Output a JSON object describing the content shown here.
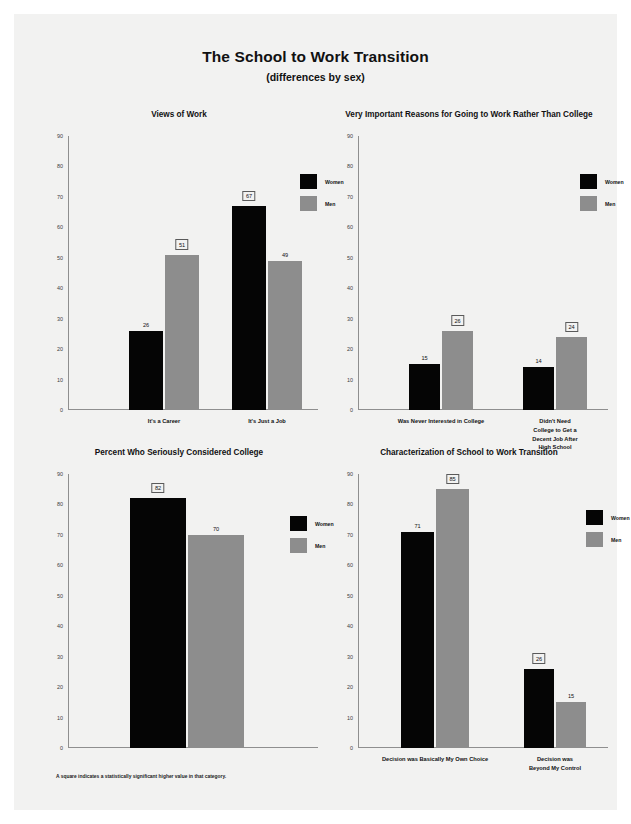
{
  "header": {
    "title": "The School to Work Transition",
    "subtitle": "(differences by sex)"
  },
  "legend": {
    "women_label": "Women",
    "men_label": "Men",
    "women_color": "#050505",
    "men_color": "#8d8d8d"
  },
  "footnote": "A square indicates a statistically significant higher value in that category.",
  "axis": {
    "ticks": [
      "0",
      "10",
      "20",
      "30",
      "40",
      "50",
      "60",
      "70",
      "80",
      "90"
    ],
    "min": 0,
    "max": 90
  },
  "chart_data": [
    {
      "type": "bar",
      "title": "Views of Work",
      "xlabel": "",
      "ylabel": "",
      "ylim": [
        0,
        90
      ],
      "grid": false,
      "legend_position": "top-right",
      "categories": [
        "It's a Career",
        "It's Just a Job"
      ],
      "series": [
        {
          "name": "Women",
          "values": [
            26,
            67
          ],
          "significant": [
            false,
            true
          ]
        },
        {
          "name": "Men",
          "values": [
            51,
            49
          ],
          "significant": [
            true,
            false
          ]
        }
      ]
    },
    {
      "type": "bar",
      "title": "Very Important Reasons for Going to Work Rather Than College",
      "xlabel": "",
      "ylabel": "",
      "ylim": [
        0,
        90
      ],
      "grid": false,
      "legend_position": "top-right",
      "categories": [
        "Was Never Interested in College",
        "Didn't Need College to Get a\nDecent Job After High School"
      ],
      "series": [
        {
          "name": "Women",
          "values": [
            15,
            14
          ],
          "significant": [
            false,
            false
          ]
        },
        {
          "name": "Men",
          "values": [
            26,
            24
          ],
          "significant": [
            true,
            true
          ]
        }
      ]
    },
    {
      "type": "bar",
      "title": "Percent Who Seriously Considered College",
      "xlabel": "",
      "ylabel": "",
      "ylim": [
        0,
        90
      ],
      "grid": false,
      "legend_position": "top-right",
      "categories": [
        ""
      ],
      "series": [
        {
          "name": "Women",
          "values": [
            82
          ],
          "significant": [
            true
          ]
        },
        {
          "name": "Men",
          "values": [
            70
          ],
          "significant": [
            false
          ]
        }
      ]
    },
    {
      "type": "bar",
      "title": "Characterization of School to Work Transition",
      "xlabel": "",
      "ylabel": "",
      "ylim": [
        0,
        90
      ],
      "grid": false,
      "legend_position": "top-right",
      "categories": [
        "Decision was Basically My Own Choice",
        "Decision was Beyond My Control"
      ],
      "series": [
        {
          "name": "Women",
          "values": [
            71,
            26
          ],
          "significant": [
            false,
            true
          ]
        },
        {
          "name": "Men",
          "values": [
            85,
            15
          ],
          "significant": [
            true,
            false
          ]
        }
      ]
    }
  ]
}
